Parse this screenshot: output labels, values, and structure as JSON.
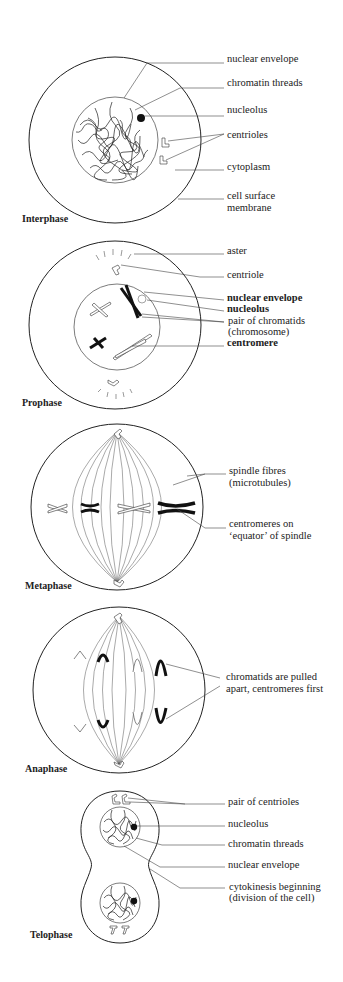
{
  "diagram": {
    "stages": [
      {
        "name": "Interphase",
        "labels": [
          "nuclear envelope",
          "chromatin threads",
          "nucleolus",
          "centrioles",
          "cytoplasm",
          "cell surface",
          "membrane"
        ]
      },
      {
        "name": "Prophase",
        "labels": [
          "aster",
          "centriole",
          "nuclear envelope",
          "nucleolus",
          "pair of chromatids",
          "(chromosome)",
          "centromere"
        ]
      },
      {
        "name": "Metaphase",
        "labels": [
          "spindle fibres",
          "(microtubules)",
          "centromeres on",
          "‘equator’ of spindle"
        ]
      },
      {
        "name": "Anaphase",
        "labels": [
          "chromatids are pulled",
          "apart, centromeres first"
        ]
      },
      {
        "name": "Telophase",
        "labels": [
          "pair of centrioles",
          "nucleolus",
          "chromatin threads",
          "nuclear envelope",
          "cytokinesis beginning",
          "(division of the cell)"
        ]
      }
    ]
  }
}
